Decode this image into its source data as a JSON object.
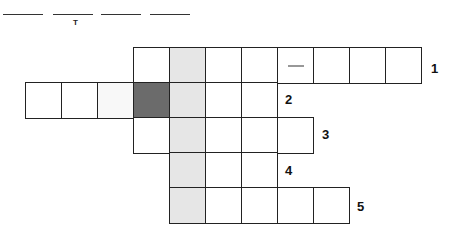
{
  "answer_blanks": {
    "lines": [
      {
        "x": 3,
        "w": 40,
        "y": 14
      },
      {
        "x": 53,
        "w": 40,
        "y": 14
      },
      {
        "x": 101,
        "w": 40,
        "y": 14
      },
      {
        "x": 150,
        "w": 40,
        "y": 14
      }
    ],
    "hint_letter": "T"
  },
  "colors": {
    "grid_line": "#222222",
    "shaded_column": "#e6e6e6",
    "dark_cell": "#6b6b6b"
  },
  "rows": [
    {
      "number": "1",
      "cells": [
        "",
        "light",
        "",
        "",
        "dash",
        "",
        "",
        ""
      ]
    },
    {
      "number": "2",
      "cells": [
        "",
        "",
        "faint",
        "dark",
        "light",
        "",
        ""
      ]
    },
    {
      "number": "3",
      "cells": [
        "",
        "light",
        "",
        "",
        ""
      ]
    },
    {
      "number": "4",
      "cells": [
        "light",
        "",
        ""
      ]
    },
    {
      "number": "5",
      "cells": [
        "light",
        "",
        "",
        "",
        ""
      ]
    }
  ]
}
